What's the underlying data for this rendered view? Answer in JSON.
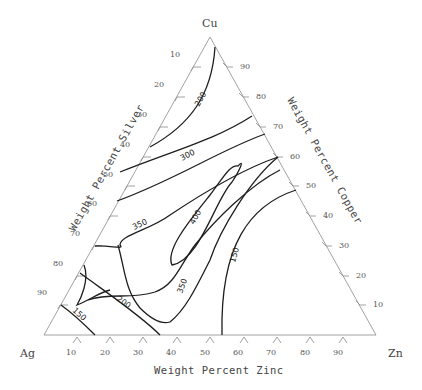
{
  "diagram": {
    "type": "ternary-contour",
    "vertices": {
      "top": "Cu",
      "left": "Ag",
      "right": "Zn"
    },
    "axis_titles": {
      "left": "Weight Percent Silver",
      "right": "Weight Percent Copper",
      "bottom": "Weight Percent Zinc"
    },
    "ticks": {
      "left": [
        "10",
        "20",
        "30",
        "40",
        "50",
        "60",
        "70",
        "80",
        "90"
      ],
      "right": [
        "90",
        "80",
        "70",
        "60",
        "50",
        "40",
        "30",
        "20",
        "10"
      ],
      "bottom": [
        "10",
        "20",
        "30",
        "40",
        "50",
        "60",
        "70",
        "80",
        "90"
      ]
    },
    "contour_labels": {
      "c200_top": "200",
      "c300": "300",
      "c350_left": "350",
      "c400": "400",
      "c350_bottom": "350",
      "c150_right": "150",
      "c200_bottom": "200",
      "c150_left": "150"
    },
    "colors": {
      "axis": "#8a8a8a",
      "contour": "#1e1e1e",
      "text": "#444444"
    }
  }
}
